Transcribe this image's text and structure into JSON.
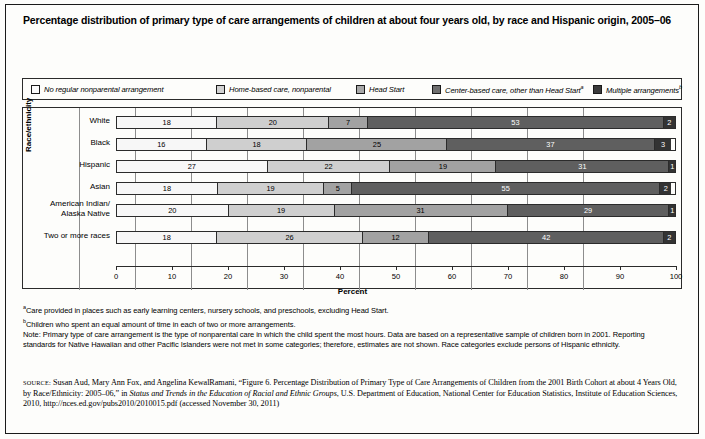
{
  "title": "Percentage distribution of primary type of care arrangements of children at about four years old, by race and Hispanic origin, 2005–06",
  "legend": {
    "items": [
      {
        "label": "No regular nonparental arrangement",
        "sup": "",
        "color": "#fbfbfb"
      },
      {
        "label": "Home-based care, nonparental",
        "sup": "",
        "color": "#d2d2d2"
      },
      {
        "label": "Head Start",
        "sup": "",
        "color": "#a8a8a8"
      },
      {
        "label": "Center-based care, other than Head Start",
        "sup": "a",
        "color": "#6e6e6e"
      },
      {
        "label": "Multiple arrangements",
        "sup": "b",
        "color": "#3a3a3a"
      }
    ]
  },
  "axes": {
    "y_title": "Race/ethnicity",
    "x_title": "Percent",
    "x_ticks": [
      "0",
      "10",
      "20",
      "30",
      "40",
      "50",
      "60",
      "70",
      "80",
      "90",
      "100"
    ]
  },
  "notes": {
    "footnote_a_marker": "a",
    "footnote_a": "Care provided in places such as early learning centers, nursery schools, and preschools, excluding Head Start.",
    "footnote_b_marker": "b",
    "footnote_b": "Children who spent an equal amount of time in each of two or more arrangements.",
    "note": "Note: Primary type of care arrangement is the type of nonparental care in which the child spent the most hours. Data are based on a representative sample of children born in 2001. Reporting standards for Native Hawaiian and other Pacific Islanders were not met in some categories; therefore, estimates are not shown. Race categories exclude persons of Hispanic ethnicity."
  },
  "source": {
    "tag": "SOURCE:",
    "part1": " Susan Aud, Mary Ann Fox, and Angelina KewalRamani, “Figure 6. Percentage Distribution of Primary Type of Care Arrangements of Children from the 2001 Birth Cohort at about 4 Years Old, by Race/Ethnicity: 2005–06,” in ",
    "italic": "Status and Trends in the Education of Racial and Ethnic Groups",
    "part2": ", U.S. Department of Education, National Center for Education Statistics, Institute of Education Sciences, 2010, http://nces.ed.gov/pubs2010/2010015.pdf (accessed November 30, 2011)"
  },
  "chart_data": {
    "type": "bar",
    "orientation": "horizontal",
    "stacked": true,
    "title": "Percentage distribution of primary type of care arrangements of children at about four years old, by race and Hispanic origin, 2005–06",
    "xlabel": "Percent",
    "ylabel": "Race/ethnicity",
    "xlim": [
      0,
      100
    ],
    "xticks": [
      0,
      10,
      20,
      30,
      40,
      50,
      60,
      70,
      80,
      90,
      100
    ],
    "grid": true,
    "legend_position": "top",
    "categories": [
      "White",
      "Black",
      "Hispanic",
      "Asian",
      "American Indian/\nAlaska Native",
      "Two or more races"
    ],
    "series": [
      {
        "name": "No regular nonparental arrangement",
        "color": "#f7f7f7",
        "values": [
          18,
          16,
          27,
          18,
          20,
          18
        ]
      },
      {
        "name": "Home-based care, nonparental",
        "color": "#cfcfcf",
        "values": [
          20,
          18,
          22,
          19,
          19,
          26
        ]
      },
      {
        "name": "Head Start",
        "color": "#a2a2a2",
        "values": [
          7,
          25,
          19,
          5,
          31,
          12
        ]
      },
      {
        "name": "Center-based care, other than Head Start",
        "color": "#5f5f5f",
        "values": [
          53,
          37,
          31,
          55,
          29,
          42
        ]
      },
      {
        "name": "Multiple arrangements",
        "color": "#333333",
        "values": [
          2,
          3,
          1,
          2,
          1,
          2
        ]
      }
    ]
  }
}
